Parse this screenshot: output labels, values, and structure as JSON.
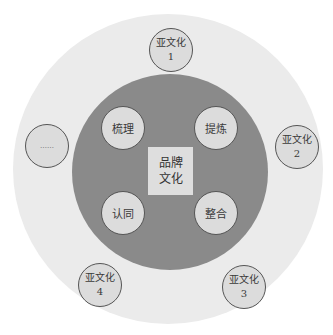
{
  "diagram": {
    "type": "concentric-circle-diagram",
    "center": {
      "line1": "品牌",
      "line2": "文化"
    },
    "processes": [
      {
        "label": "梳理",
        "position": "top-left"
      },
      {
        "label": "提炼",
        "position": "top-right"
      },
      {
        "label": "认同",
        "position": "bottom-left"
      },
      {
        "label": "整合",
        "position": "bottom-right"
      }
    ],
    "subcultures": [
      {
        "line1": "亚文化",
        "line2": "1",
        "position": "top"
      },
      {
        "line1": "亚文化",
        "line2": "2",
        "position": "right"
      },
      {
        "line1": "亚文化",
        "line2": "3",
        "position": "bottom-right"
      },
      {
        "line1": "亚文化",
        "line2": "4",
        "position": "bottom-left"
      },
      {
        "line1": "……",
        "line2": "",
        "position": "left"
      }
    ],
    "colors": {
      "outer_ring": "#ebebeb",
      "core": "#8a8a8a",
      "node_fill": "#dcdcdc",
      "node_border": "#555555",
      "center_box": "#dedede"
    }
  }
}
